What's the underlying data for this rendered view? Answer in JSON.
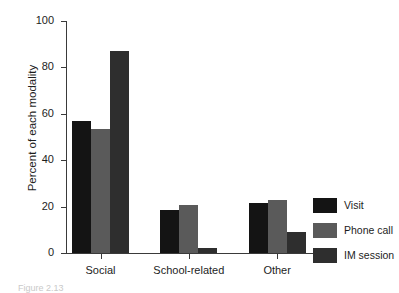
{
  "chart_data": {
    "type": "bar",
    "title": "",
    "xlabel": "",
    "ylabel": "Percent of each modality",
    "categories": [
      "Social",
      "School-related",
      "Other"
    ],
    "series": [
      {
        "name": "Visit",
        "color": "#141414",
        "values": [
          57,
          18.5,
          21.5
        ]
      },
      {
        "name": "Phone call",
        "color": "#5a5a5a",
        "values": [
          53.5,
          20.5,
          23
        ]
      },
      {
        "name": "IM session",
        "color": "#2e2e2e",
        "values": [
          87,
          2,
          9
        ]
      }
    ],
    "ylim": [
      0,
      100
    ],
    "yticks": [
      0,
      20,
      40,
      60,
      80,
      100
    ],
    "ytick_labels": [
      "0",
      "20",
      "40",
      "60",
      "80",
      "100"
    ],
    "grid": false,
    "legend_position": "right-bottom"
  },
  "legend": {
    "entries": [
      {
        "label": "Visit"
      },
      {
        "label": "Phone call"
      },
      {
        "label": "IM session"
      }
    ]
  },
  "caption": {
    "text": "Figure 2.13"
  }
}
